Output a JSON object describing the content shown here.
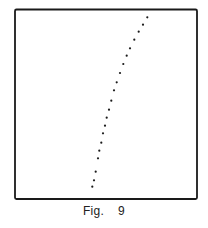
{
  "figure": {
    "caption_label": "Fig.",
    "caption_number": "9"
  },
  "colors": {
    "frame": "#1a1a1a",
    "points": "#1a1a1a",
    "background": "#ffffff"
  },
  "chart_data": {
    "type": "scatter",
    "title": "",
    "xlabel": "",
    "ylabel": "",
    "grid": false,
    "legend": "none",
    "frame_px": {
      "left": 15,
      "top": 9,
      "right": 197,
      "bottom": 199
    },
    "points_px": [
      [
        147.3,
        17.3
      ],
      [
        143.0,
        24.7
      ],
      [
        138.7,
        31.7
      ],
      [
        134.3,
        39.7
      ],
      [
        130.0,
        48.3
      ],
      [
        126.7,
        55.7
      ],
      [
        123.3,
        64.0
      ],
      [
        120.0,
        73.0
      ],
      [
        116.7,
        82.3
      ],
      [
        114.0,
        90.3
      ],
      [
        111.3,
        100.7
      ],
      [
        109.0,
        109.7
      ],
      [
        106.7,
        117.7
      ],
      [
        105.0,
        125.7
      ],
      [
        103.0,
        133.3
      ],
      [
        101.3,
        142.7
      ],
      [
        99.3,
        150.7
      ],
      [
        98.0,
        158.3
      ],
      [
        95.7,
        171.7
      ],
      [
        94.0,
        180.3
      ],
      [
        92.3,
        186.7
      ]
    ]
  }
}
